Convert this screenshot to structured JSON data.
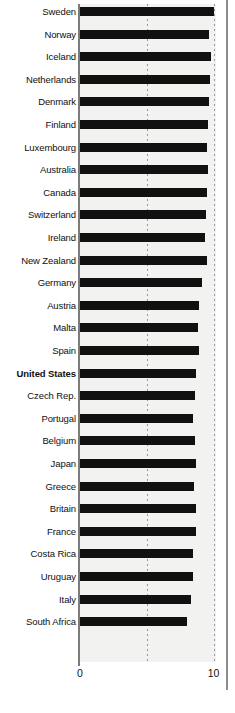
{
  "chart_data": {
    "type": "bar",
    "orientation": "horizontal",
    "title": "",
    "subtitle": "",
    "xlabel": "",
    "ylabel": "",
    "xlim": [
      0,
      10.3
    ],
    "xticks": [
      0,
      10
    ],
    "xtick_labels": [
      "0",
      "10"
    ],
    "gridlines": [
      5,
      10
    ],
    "grid": true,
    "legend": null,
    "highlighted_category": "United States",
    "categories": [
      "Sweden",
      "Norway",
      "Iceland",
      "Netherlands",
      "Denmark",
      "Finland",
      "Luxembourg",
      "Australia",
      "Canada",
      "Switzerland",
      "Ireland",
      "New Zealand",
      "Germany",
      "Austria",
      "Malta",
      "Spain",
      "United States",
      "Czech Rep.",
      "Portugal",
      "Belgium",
      "Japan",
      "Greece",
      "Britain",
      "France",
      "Costa Rica",
      "Uruguay",
      "Italy",
      "South Africa"
    ],
    "values": [
      10.0,
      9.7,
      9.85,
      9.75,
      9.65,
      9.6,
      9.5,
      9.6,
      9.5,
      9.45,
      9.4,
      9.5,
      9.15,
      8.9,
      8.85,
      8.9,
      8.7,
      8.65,
      8.45,
      8.65,
      8.7,
      8.55,
      8.7,
      8.7,
      8.5,
      8.45,
      8.35,
      8.0
    ]
  },
  "axis": {
    "tick_zero": "0",
    "tick_ten": "10"
  },
  "colors": {
    "bar": "#111111",
    "plot_background": "#f2f2f0",
    "axis_line": "#7b7b7b",
    "gridline": "#9a9a9a",
    "text": "#101010",
    "page_background": "#ffffff"
  }
}
